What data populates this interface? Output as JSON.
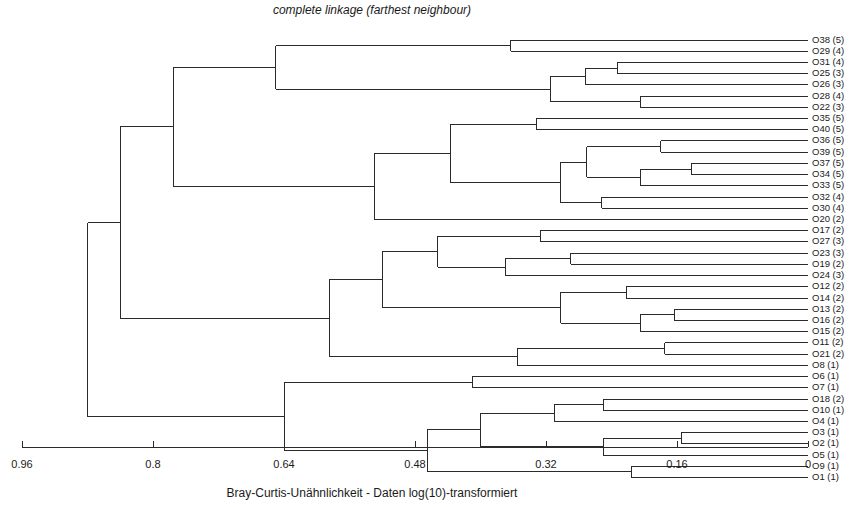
{
  "chart_data": {
    "type": "dendrogram",
    "title": "complete linkage (farthest neighbour)",
    "xlabel": "Bray-Curtis-Unähnlichkeit - Daten log(10)-transformiert",
    "ylabel": "",
    "xlim": [
      0.96,
      0.0
    ],
    "x_reversed": true,
    "grid": false,
    "legend": null,
    "xticks": [
      0.96,
      0.8,
      0.64,
      0.48,
      0.32,
      0.16,
      0
    ],
    "xtick_labels": [
      "0.96",
      "0.8",
      "0.64",
      "0.48",
      "0.32",
      "0.16",
      "0"
    ],
    "leaf_labels": [
      "O38 (5)",
      "O29 (4)",
      "O31 (4)",
      "O25 (3)",
      "O26 (3)",
      "O28 (4)",
      "O22 (3)",
      "O35 (5)",
      "O40 (5)",
      "O36 (5)",
      "O39 (5)",
      "O37 (5)",
      "O34 (5)",
      "O33 (5)",
      "O32 (4)",
      "O30 (4)",
      "O20 (2)",
      "O17 (2)",
      "O27 (3)",
      "O23 (3)",
      "O19 (2)",
      "O24 (3)",
      "O12 (2)",
      "O14 (2)",
      "O13 (2)",
      "O16 (2)",
      "O15 (2)",
      "O11 (2)",
      "O21 (2)",
      "O8 (1)",
      "O6 (1)",
      "O7 (1)",
      "O18 (2)",
      "O10 (1)",
      "O4 (1)",
      "O3 (1)",
      "O2 (1)",
      "O5 (1)",
      "O9 (1)",
      "O1 (1)"
    ],
    "leaf_order": [
      38,
      29,
      31,
      25,
      26,
      28,
      22,
      35,
      40,
      36,
      39,
      37,
      34,
      33,
      32,
      30,
      20,
      17,
      27,
      23,
      19,
      24,
      12,
      14,
      13,
      16,
      15,
      11,
      21,
      8,
      6,
      7,
      18,
      10,
      4,
      3,
      2,
      5,
      9,
      1
    ],
    "merges": [
      {
        "id": "n1",
        "left": {
          "leaf": 0
        },
        "right": {
          "leaf": 1
        },
        "height": 0.363
      },
      {
        "id": "n2",
        "left": {
          "leaf": 2
        },
        "right": {
          "leaf": 3
        },
        "height": 0.233
      },
      {
        "id": "n3",
        "left": {
          "node": "n2"
        },
        "right": {
          "leaf": 4
        },
        "height": 0.272
      },
      {
        "id": "n4",
        "left": {
          "leaf": 5
        },
        "right": {
          "leaf": 6
        },
        "height": 0.205
      },
      {
        "id": "n5",
        "left": {
          "node": "n3"
        },
        "right": {
          "node": "n4"
        },
        "height": 0.315
      },
      {
        "id": "n6",
        "left": {
          "node": "n1"
        },
        "right": {
          "node": "n5"
        },
        "height": 0.65
      },
      {
        "id": "n7",
        "left": {
          "leaf": 7
        },
        "right": {
          "leaf": 8
        },
        "height": 0.332
      },
      {
        "id": "n8",
        "left": {
          "leaf": 9
        },
        "right": {
          "leaf": 10
        },
        "height": 0.18
      },
      {
        "id": "n9",
        "left": {
          "leaf": 11
        },
        "right": {
          "leaf": 12
        },
        "height": 0.142
      },
      {
        "id": "n10",
        "left": {
          "node": "n9"
        },
        "right": {
          "leaf": 13
        },
        "height": 0.205
      },
      {
        "id": "n11",
        "left": {
          "node": "n8"
        },
        "right": {
          "node": "n10"
        },
        "height": 0.27
      },
      {
        "id": "n12",
        "left": {
          "leaf": 14
        },
        "right": {
          "leaf": 15
        },
        "height": 0.252
      },
      {
        "id": "n13",
        "left": {
          "node": "n11"
        },
        "right": {
          "node": "n12"
        },
        "height": 0.302
      },
      {
        "id": "n14",
        "left": {
          "node": "n7"
        },
        "right": {
          "node": "n13"
        },
        "height": 0.437
      },
      {
        "id": "n15",
        "left": {
          "node": "n14"
        },
        "right": {
          "leaf": 16
        },
        "height": 0.53
      },
      {
        "id": "n16",
        "left": {
          "node": "n6"
        },
        "right": {
          "node": "n15"
        },
        "height": 0.775
      },
      {
        "id": "n17",
        "left": {
          "leaf": 17
        },
        "right": {
          "leaf": 18
        },
        "height": 0.327
      },
      {
        "id": "n18",
        "left": {
          "leaf": 19
        },
        "right": {
          "leaf": 20
        },
        "height": 0.29
      },
      {
        "id": "n19",
        "left": {
          "node": "n18"
        },
        "right": {
          "leaf": 21
        },
        "height": 0.37
      },
      {
        "id": "n20",
        "left": {
          "node": "n17"
        },
        "right": {
          "node": "n19"
        },
        "height": 0.452
      },
      {
        "id": "n21",
        "left": {
          "leaf": 22
        },
        "right": {
          "leaf": 23
        },
        "height": 0.222
      },
      {
        "id": "n22",
        "left": {
          "leaf": 24
        },
        "right": {
          "leaf": 25
        },
        "height": 0.163
      },
      {
        "id": "n23",
        "left": {
          "node": "n22"
        },
        "right": {
          "leaf": 26
        },
        "height": 0.205
      },
      {
        "id": "n24",
        "left": {
          "node": "n21"
        },
        "right": {
          "node": "n23"
        },
        "height": 0.302
      },
      {
        "id": "n25",
        "left": {
          "node": "n20"
        },
        "right": {
          "node": "n24"
        },
        "height": 0.52
      },
      {
        "id": "n26",
        "left": {
          "leaf": 27
        },
        "right": {
          "leaf": 28
        },
        "height": 0.175
      },
      {
        "id": "n27",
        "left": {
          "node": "n26"
        },
        "right": {
          "leaf": 29
        },
        "height": 0.355
      },
      {
        "id": "n28",
        "left": {
          "node": "n25"
        },
        "right": {
          "node": "n27"
        },
        "height": 0.585
      },
      {
        "id": "n29",
        "left": {
          "node": "n16"
        },
        "right": {
          "node": "n28"
        },
        "height": 0.84
      },
      {
        "id": "n30",
        "left": {
          "leaf": 30
        },
        "right": {
          "leaf": 31
        },
        "height": 0.41
      },
      {
        "id": "n31",
        "left": {
          "leaf": 32
        },
        "right": {
          "leaf": 33
        },
        "height": 0.25
      },
      {
        "id": "n32",
        "left": {
          "node": "n31"
        },
        "right": {
          "leaf": 34
        },
        "height": 0.31
      },
      {
        "id": "n33",
        "left": {
          "leaf": 35
        },
        "right": {
          "leaf": 36
        },
        "height": 0.155
      },
      {
        "id": "n34",
        "left": {
          "node": "n33"
        },
        "right": {
          "leaf": 37
        },
        "height": 0.25
      },
      {
        "id": "n35",
        "left": {
          "node": "n32"
        },
        "right": {
          "node": "n34"
        },
        "height": 0.4
      },
      {
        "id": "n36",
        "left": {
          "leaf": 38
        },
        "right": {
          "leaf": 39
        },
        "height": 0.215
      },
      {
        "id": "n37",
        "left": {
          "node": "n35"
        },
        "right": {
          "node": "n36"
        },
        "height": 0.465
      },
      {
        "id": "n38",
        "left": {
          "node": "n30"
        },
        "right": {
          "node": "n37"
        },
        "height": 0.64
      },
      {
        "id": "n39",
        "left": {
          "node": "n29"
        },
        "right": {
          "node": "n38"
        },
        "height": 0.88
      }
    ],
    "root": "n39"
  },
  "geometry": {
    "plot_left_px": 22,
    "plot_right_px": 808,
    "axis_y_px": 447,
    "first_leaf_y_px": 40,
    "leaf_spacing_px": 11.22,
    "label_x_px": 812,
    "title_x_px": 372,
    "title_y_px": 14,
    "caption_x_px": 372,
    "caption_y_px": 497,
    "tick_len_px": 6,
    "tick_label_y_px": 468
  },
  "colors": {
    "line": "#2b2b2b",
    "text": "#1a1a1a",
    "background": "#ffffff"
  }
}
